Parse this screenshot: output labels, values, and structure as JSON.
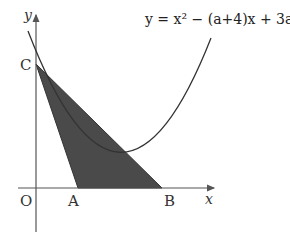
{
  "equation": {
    "text": "y = x² − (a+4)x + 3a + 3"
  },
  "axes": {
    "x_label": "x",
    "y_label": "y",
    "origin_label": "O"
  },
  "points": {
    "A": "A",
    "B": "B",
    "C": "C"
  },
  "colors": {
    "shade": "#4a4a4a",
    "line": "#333333",
    "axis": "#555555"
  }
}
